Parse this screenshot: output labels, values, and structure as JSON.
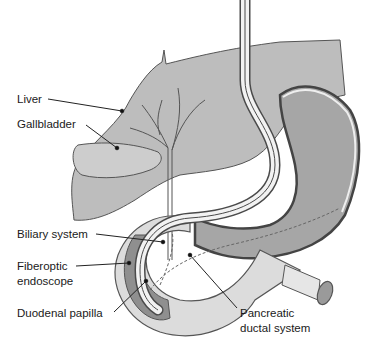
{
  "figure": {
    "colors": {
      "liver_fill": "#b9b9b9",
      "liver_stroke": "#555555",
      "stomach_fill": "#a3a3a3",
      "stomach_wall": "#e6e6e6",
      "duodenum_fill": "#dedede",
      "mucosa_dark": "#8c8c8c",
      "scope_fill": "#f0f0f0",
      "outline": "#4a4a4a",
      "label_text": "#1a1a1a",
      "background": "#ffffff"
    }
  },
  "labels": {
    "liver": "Liver",
    "gallbladder": "Gallbladder",
    "biliary_system": "Biliary system",
    "fiberoptic_line1": "Fiberoptic",
    "fiberoptic_line2": "endoscope",
    "duodenal_papilla": "Duodenal papilla",
    "pancreatic_line1": "Pancreatic",
    "pancreatic_line2": "ductal system"
  }
}
